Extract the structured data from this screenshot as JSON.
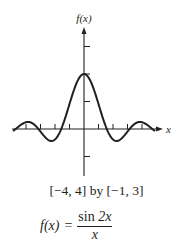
{
  "chart_data": {
    "type": "line",
    "title": "",
    "xlabel": "x",
    "ylabel": "f(x)",
    "function": "sin(2x)/x",
    "window_caption": "[−4, 4] by [−1, 3]",
    "xlim": [
      -4,
      4
    ],
    "ylim": [
      -1,
      3
    ],
    "x_ticks": [
      -4,
      -3,
      -2,
      -1,
      1,
      2,
      3,
      4
    ],
    "y_ticks": [
      -1,
      1,
      2,
      3
    ],
    "grid": false,
    "legend": null,
    "series": [
      {
        "name": "f(x) = sin 2x / x",
        "x": [
          -4.9,
          -4.5,
          -4,
          -3.5,
          -3,
          -2.5,
          -2,
          -1.5,
          -1,
          -0.5,
          0,
          0.5,
          1,
          1.5,
          2,
          2.5,
          3,
          3.5,
          4,
          4.5,
          4.9
        ],
        "y": [
          0.08,
          0.09,
          0.25,
          0.19,
          0.09,
          0.38,
          -0.38,
          0.09,
          0.91,
          1.68,
          2,
          1.68,
          0.91,
          0.09,
          -0.38,
          -0.38,
          -0.09,
          0.19,
          0.25,
          0.09,
          -0.08
        ]
      }
    ],
    "color": "#231f20"
  },
  "labels": {
    "y_axis": "f(x)",
    "x_axis": "x",
    "range": "[−4, 4] by [−1, 3]",
    "formula_lhs": "f(x)",
    "formula_eq": "=",
    "formula_num_fn": "sin",
    "formula_num_arg": "2x",
    "formula_den": "x"
  }
}
